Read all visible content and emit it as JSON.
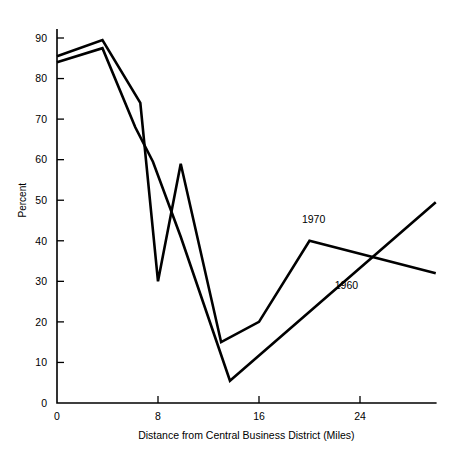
{
  "chart_data": {
    "type": "line",
    "title": "",
    "xlabel": "Distance from Central Business District (Miles)",
    "ylabel": "Percent",
    "xlim": [
      0,
      30
    ],
    "ylim": [
      0,
      92
    ],
    "xticks": [
      0,
      8,
      16,
      24
    ],
    "xticklabels": [
      "0",
      "8",
      "16",
      "24"
    ],
    "yticks": [
      0,
      10,
      20,
      30,
      40,
      50,
      60,
      70,
      80,
      90
    ],
    "yticklabels": [
      "0",
      "10",
      "20",
      "30",
      "40",
      "50",
      "60",
      "70",
      "80",
      "90"
    ],
    "grid": false,
    "legend_position": "inline-annotation",
    "line_color": "#000000",
    "series": [
      {
        "name": "1970",
        "label_x": 19.4,
        "label_y": 44.5,
        "points": [
          {
            "x": 0.0,
            "y": 85.5
          },
          {
            "x": 3.6,
            "y": 89.5
          },
          {
            "x": 6.6,
            "y": 74.0
          },
          {
            "x": 8.0,
            "y": 30.0
          },
          {
            "x": 9.8,
            "y": 59.0
          },
          {
            "x": 13.0,
            "y": 15.0
          },
          {
            "x": 16.0,
            "y": 20.0
          },
          {
            "x": 20.0,
            "y": 40.0
          },
          {
            "x": 30.0,
            "y": 32.0
          }
        ]
      },
      {
        "name": "1960",
        "label_x": 22.0,
        "label_y": 28.0,
        "points": [
          {
            "x": 0.0,
            "y": 84.0
          },
          {
            "x": 3.6,
            "y": 87.5
          },
          {
            "x": 6.2,
            "y": 68.0
          },
          {
            "x": 7.6,
            "y": 59.5
          },
          {
            "x": 9.8,
            "y": 41.0
          },
          {
            "x": 13.7,
            "y": 5.5
          },
          {
            "x": 30.0,
            "y": 49.5
          }
        ]
      }
    ]
  }
}
